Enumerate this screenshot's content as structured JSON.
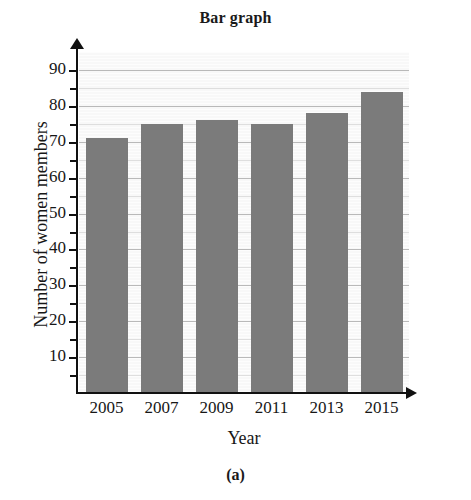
{
  "figure": {
    "title": "Bar graph",
    "caption": "(a)"
  },
  "chart_data": {
    "type": "bar",
    "title": "Bar graph",
    "xlabel": "Year",
    "ylabel": "Number of women members",
    "categories": [
      "2005",
      "2007",
      "2009",
      "2011",
      "2013",
      "2015"
    ],
    "values": [
      71,
      75,
      76,
      75,
      78,
      84
    ],
    "ylim": [
      0,
      95
    ],
    "xlim_note": "categorical",
    "y_ticks": [
      10,
      20,
      30,
      40,
      50,
      60,
      70,
      80,
      90
    ],
    "y_tick_labels": [
      "10",
      "20",
      "30",
      "40",
      "50",
      "60",
      "70",
      "80",
      "90"
    ],
    "y_minor_ticks": [
      5,
      15,
      25,
      35,
      45,
      55,
      65,
      75,
      85
    ],
    "grid": true,
    "grid_axis": "y",
    "legend": false,
    "legend_position": "none",
    "bar_color": "#7b7b7b",
    "plot_background": "#f2f2f2",
    "gridline_color": "#b9b9b9",
    "axis_color": "#111111",
    "axis_arrows": [
      "y-up",
      "x-right"
    ],
    "series": [
      {
        "name": "Number of women members",
        "values": [
          71,
          75,
          76,
          75,
          78,
          84
        ]
      }
    ]
  }
}
